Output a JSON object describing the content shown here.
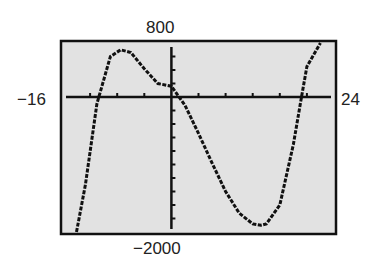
{
  "chart_data": {
    "type": "line",
    "title": "",
    "xlabel": "",
    "ylabel": "",
    "xlim": [
      -16,
      24
    ],
    "ylim": [
      -2000,
      800
    ],
    "x_scale": 4,
    "y_scale": 200,
    "labels": {
      "ymax": "800",
      "ymin": "−2000",
      "xmin": "−16",
      "xmax": "24"
    },
    "grid": false,
    "series": [
      {
        "name": "f(x)",
        "x": [
          -14,
          -12.7,
          -11,
          -9,
          -7.5,
          -6,
          -4,
          -2,
          0,
          2,
          4,
          6,
          8,
          10,
          12,
          13.2,
          14,
          16,
          18,
          19.2,
          20,
          22
        ],
        "y": [
          -2000,
          -1300,
          -100,
          600,
          700,
          660,
          420,
          200,
          160,
          -120,
          -540,
          -980,
          -1400,
          -1720,
          -1880,
          -1900,
          -1880,
          -1600,
          -700,
          0,
          450,
          800
        ]
      }
    ],
    "window_bg": "#e4e4e4",
    "curve_color": "#111111"
  }
}
